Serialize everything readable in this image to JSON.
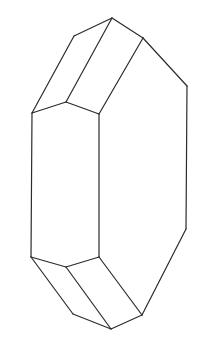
{
  "figure": {
    "type": "crystal-line-drawing",
    "stroke_color": "#2b2b2b",
    "background": "#ffffff",
    "vertices": {
      "top_apex": [
        112,
        18
      ],
      "top_left": [
        74,
        36
      ],
      "top_right": [
        143,
        38
      ],
      "right_upper": [
        187,
        86
      ],
      "left_upper": [
        32,
        113
      ],
      "mid_upper": [
        66,
        102
      ],
      "front_upper": [
        99,
        114
      ],
      "left_lower": [
        31,
        257
      ],
      "mid_lower": [
        66,
        267
      ],
      "front_lower": [
        99,
        257
      ],
      "bottom_left": [
        73,
        314
      ],
      "bottom_apex": [
        111,
        329
      ],
      "bottom_right": [
        142,
        315
      ],
      "right_lower": [
        186,
        229
      ]
    },
    "edges": [
      [
        "top_left",
        "top_apex"
      ],
      [
        "top_apex",
        "top_right"
      ],
      [
        "top_right",
        "right_upper"
      ],
      [
        "right_upper",
        "right_lower"
      ],
      [
        "top_left",
        "left_upper"
      ],
      [
        "top_apex",
        "mid_upper"
      ],
      [
        "top_right",
        "front_upper"
      ],
      [
        "left_upper",
        "mid_upper"
      ],
      [
        "mid_upper",
        "front_upper"
      ],
      [
        "left_upper",
        "left_lower"
      ],
      [
        "front_upper",
        "front_lower"
      ],
      [
        "left_lower",
        "mid_lower"
      ],
      [
        "mid_lower",
        "front_lower"
      ],
      [
        "left_lower",
        "bottom_left"
      ],
      [
        "mid_lower",
        "bottom_apex"
      ],
      [
        "front_lower",
        "bottom_right"
      ],
      [
        "bottom_left",
        "bottom_apex"
      ],
      [
        "bottom_apex",
        "bottom_right"
      ],
      [
        "bottom_right",
        "right_lower"
      ]
    ]
  }
}
